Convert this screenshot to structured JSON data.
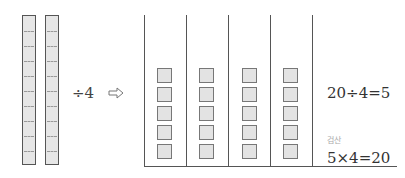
{
  "left_model": {
    "bars": 2,
    "segments_per_bar": 10,
    "operator_text": "÷4",
    "arrow_icon": "right-arrow-icon"
  },
  "groups": {
    "count": 4,
    "items_per_group": 5
  },
  "equations": {
    "division": "20÷4=5",
    "check_label": "검산",
    "multiplication": "5×4=20"
  },
  "colors": {
    "fill": "#e3e3e3",
    "stroke": "#555555"
  }
}
